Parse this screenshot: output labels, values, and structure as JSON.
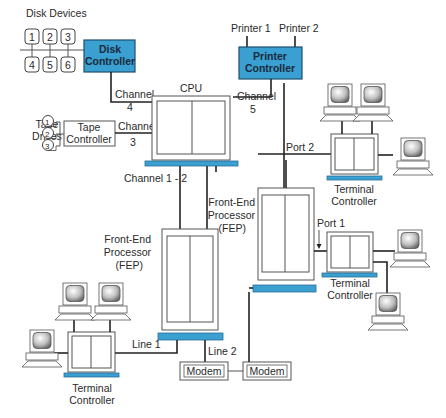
{
  "diagram": {
    "colors": {
      "accent": "#3a9fd1",
      "line": "#222222",
      "frame": "#555555"
    },
    "disk": {
      "group_label": "Disk Devices",
      "disks": [
        "1",
        "2",
        "3",
        "4",
        "5",
        "6"
      ],
      "controller_line1": "Disk",
      "controller_line2": "Controller"
    },
    "printers": {
      "printer1": "Printer 1",
      "printer2": "Printer 2",
      "controller_line1": "Printer",
      "controller_line2": "Controller"
    },
    "tape": {
      "group_line1": "Tape",
      "group_line2": "Drives",
      "drives": [
        "1",
        "2",
        "3"
      ],
      "controller_line1": "Tape",
      "controller_line2": "Controller"
    },
    "cpu": {
      "label": "CPU"
    },
    "channels": {
      "ch4_word": "Channel",
      "ch4_num": "4",
      "ch3_word": "Channel",
      "ch3_num": "3",
      "ch5_word": "Channel",
      "ch5_num": "5",
      "ch12": "Channel 1 - 2"
    },
    "fep_left": {
      "line1": "Front-End",
      "line2": "Processor",
      "line3": "(FEP)"
    },
    "fep_right": {
      "line1": "Front-End",
      "line2": "Processor",
      "line3": "(FEP)"
    },
    "ports": {
      "port1": "Port 1",
      "port2": "Port 2"
    },
    "lines": {
      "line1": "Line 1",
      "line2": "Line 2"
    },
    "modems": [
      "Modem",
      "Modem"
    ],
    "terminal_controllers": [
      {
        "line1": "Terminal",
        "line2": "Controller"
      },
      {
        "line1": "Terminal",
        "line2": "Controller"
      },
      {
        "line1": "Terminal",
        "line2": "Controller"
      }
    ]
  }
}
